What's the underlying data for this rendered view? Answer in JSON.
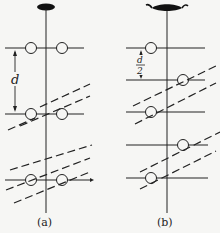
{
  "panels": [
    {
      "id": "a",
      "caption": "(a)",
      "spacing_label": "d",
      "axis_x": 46,
      "rows": [
        {
          "y": 48,
          "circles": [
            31,
            62
          ]
        },
        {
          "y": 114,
          "circles": [
            31,
            62
          ]
        },
        {
          "y": 180,
          "circles": [
            31,
            62
          ]
        }
      ],
      "dashed_planes": [
        {
          "x1": 40,
          "y1": 108,
          "x2": 90,
          "y2": 84
        },
        {
          "x1": 20,
          "y1": 126,
          "x2": 90,
          "y2": 95
        },
        {
          "x1": 8,
          "y1": 150,
          "x2": 40,
          "y2": 131
        },
        {
          "x1": 10,
          "y1": 169,
          "x2": 90,
          "y2": 145
        },
        {
          "x1": 6,
          "y1": 190,
          "x2": 90,
          "y2": 158
        },
        {
          "x1": 14,
          "y1": 202,
          "x2": 90,
          "y2": 170
        }
      ]
    },
    {
      "id": "b",
      "caption": "(b)",
      "spacing_label_num": "d",
      "spacing_label_den": "2",
      "axis_x": 167,
      "rows": [
        {
          "y": 48,
          "circles": [
            151
          ]
        },
        {
          "y": 80,
          "circles": [
            183
          ]
        },
        {
          "y": 112,
          "circles": [
            151
          ]
        },
        {
          "y": 145,
          "circles": [
            183
          ]
        },
        {
          "y": 178,
          "circles": [
            151
          ]
        }
      ],
      "dashed_planes": [
        {
          "x1": 133,
          "y1": 105,
          "x2": 215,
          "y2": 67
        },
        {
          "x1": 135,
          "y1": 123,
          "x2": 215,
          "y2": 83
        },
        {
          "x1": 140,
          "y1": 172,
          "x2": 220,
          "y2": 132
        },
        {
          "x1": 140,
          "y1": 188,
          "x2": 215,
          "y2": 150
        }
      ]
    }
  ]
}
